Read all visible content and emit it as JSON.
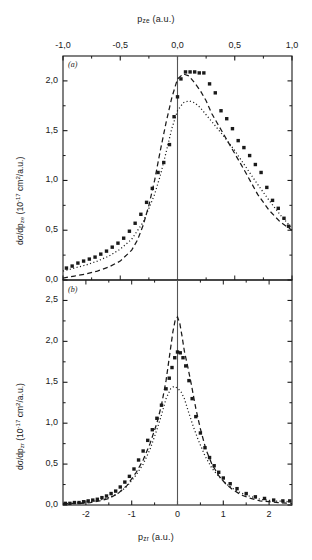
{
  "figure": {
    "background": "#ffffff",
    "foreground": "#1a1a1a",
    "width": 312,
    "height": 560
  },
  "panel_a": {
    "tag": "(a)",
    "top_axis_title_html": "p<sub>ze</sub> (a.u.)",
    "ylabel_html": "d&sigma;/dp<sub>ze</sub> (10<sup>-17</sup> cm<sup>2</sup>/a.u.)",
    "xticks": [
      "-1,0",
      "-0,5",
      "0,0",
      "0,5",
      "1,0"
    ],
    "xtick_values": [
      -1.0,
      -0.5,
      0.0,
      0.5,
      1.0
    ],
    "yticks": [
      "0,0",
      "0,5",
      "1,0",
      "1,5",
      "2,0"
    ],
    "ytick_values": [
      0.0,
      0.5,
      1.0,
      1.5,
      2.0
    ]
  },
  "panel_b": {
    "tag": "(b)",
    "bottom_axis_title_html": "p<sub>zr</sub> (a.u.)",
    "ylabel_html": "d&sigma;/dp<sub>zr</sub> (10<sup>-17</sup> cm<sup>2</sup>/a.u.)",
    "xticks": [
      "-2",
      "-1",
      "0",
      "1",
      "2"
    ],
    "xtick_values": [
      -2,
      -1,
      0,
      1,
      2
    ],
    "yticks": [
      "0,0",
      "0,5",
      "1,0",
      "1,5",
      "2,0",
      "2,5"
    ],
    "ytick_values": [
      0.0,
      0.5,
      1.0,
      1.5,
      2.0,
      2.5
    ]
  },
  "chart_data": [
    {
      "type": "scatter",
      "panel": "(a)",
      "title": "",
      "xlabel": "p_ze (a.u.)",
      "ylabel": "dsigma/dp_ze (10^-17 cm^2/a.u.)",
      "xlim": [
        -1.0,
        1.0
      ],
      "ylim": [
        0.0,
        2.25
      ],
      "xtick_labels": [
        "-1,0",
        "-0,5",
        "0,0",
        "0,5",
        "1,0"
      ],
      "ytick_labels": [
        "0,0",
        "0,5",
        "1,0",
        "1,5",
        "2,0"
      ],
      "grid": false,
      "legend": "none",
      "axis_position": "x-axis on top",
      "vertical_reference_line_x": 0.0,
      "series": [
        {
          "name": "experiment",
          "style": "filled-square-markers",
          "marker": "square",
          "x": [
            -0.97,
            -0.92,
            -0.87,
            -0.82,
            -0.77,
            -0.72,
            -0.67,
            -0.62,
            -0.57,
            -0.52,
            -0.47,
            -0.42,
            -0.37,
            -0.32,
            -0.27,
            -0.22,
            -0.17,
            -0.12,
            -0.07,
            -0.03,
            0.0,
            0.03,
            0.07,
            0.11,
            0.15,
            0.19,
            0.23,
            0.28,
            0.33,
            0.38,
            0.43,
            0.48,
            0.53,
            0.58,
            0.63,
            0.68,
            0.73,
            0.78,
            0.83,
            0.88,
            0.93,
            0.97
          ],
          "y": [
            0.12,
            0.14,
            0.17,
            0.19,
            0.21,
            0.23,
            0.26,
            0.29,
            0.33,
            0.37,
            0.42,
            0.49,
            0.57,
            0.66,
            0.78,
            0.92,
            1.08,
            1.18,
            1.36,
            1.64,
            1.84,
            2.02,
            2.09,
            2.09,
            2.09,
            2.08,
            2.08,
            1.97,
            1.88,
            1.7,
            1.62,
            1.52,
            1.4,
            1.33,
            1.25,
            1.16,
            1.08,
            0.93,
            0.8,
            0.72,
            0.62,
            0.54,
            0.45
          ]
        },
        {
          "name": "theory-dashed",
          "style": "dashed-line",
          "x": [
            -1.0,
            -0.9,
            -0.8,
            -0.7,
            -0.6,
            -0.5,
            -0.4,
            -0.35,
            -0.3,
            -0.25,
            -0.2,
            -0.15,
            -0.1,
            -0.05,
            0.0,
            0.05,
            0.1,
            0.15,
            0.2,
            0.25,
            0.3,
            0.35,
            0.4,
            0.5,
            0.6,
            0.7,
            0.8,
            0.9,
            1.0
          ],
          "y": [
            0.02,
            0.04,
            0.06,
            0.09,
            0.13,
            0.19,
            0.3,
            0.4,
            0.55,
            0.75,
            1.0,
            1.3,
            1.58,
            1.83,
            2.02,
            2.07,
            2.05,
            1.98,
            1.9,
            1.8,
            1.67,
            1.57,
            1.47,
            1.27,
            1.07,
            0.86,
            0.7,
            0.58,
            0.5
          ]
        },
        {
          "name": "theory-dotted",
          "style": "dotted-line",
          "x": [
            -1.0,
            -0.9,
            -0.8,
            -0.7,
            -0.6,
            -0.5,
            -0.4,
            -0.3,
            -0.2,
            -0.15,
            -0.1,
            -0.05,
            0.0,
            0.05,
            0.1,
            0.15,
            0.2,
            0.3,
            0.4,
            0.5,
            0.6,
            0.7,
            0.8,
            0.9,
            1.0
          ],
          "y": [
            0.09,
            0.12,
            0.15,
            0.19,
            0.24,
            0.31,
            0.41,
            0.58,
            0.86,
            1.05,
            1.28,
            1.52,
            1.7,
            1.78,
            1.8,
            1.78,
            1.73,
            1.59,
            1.45,
            1.3,
            1.13,
            0.96,
            0.8,
            0.65,
            0.52
          ]
        }
      ]
    },
    {
      "type": "scatter",
      "panel": "(b)",
      "title": "",
      "xlabel": "p_zr (a.u.)",
      "ylabel": "dsigma/dp_zr (10^-17 cm^2/a.u.)",
      "xlim": [
        -2.5,
        2.5
      ],
      "ylim": [
        0.0,
        2.75
      ],
      "xtick_labels": [
        "-2",
        "-1",
        "0",
        "1",
        "2"
      ],
      "ytick_labels": [
        "0,0",
        "0,5",
        "1,0",
        "1,5",
        "2,0",
        "2,5"
      ],
      "grid": false,
      "legend": "none",
      "axis_position": "x-axis on bottom",
      "vertical_reference_line_x": 0.0,
      "series": [
        {
          "name": "experiment",
          "style": "filled-square-markers",
          "marker": "square",
          "x": [
            -2.45,
            -2.35,
            -2.25,
            -2.15,
            -2.05,
            -1.95,
            -1.85,
            -1.75,
            -1.65,
            -1.55,
            -1.45,
            -1.35,
            -1.25,
            -1.15,
            -1.05,
            -0.95,
            -0.85,
            -0.75,
            -0.65,
            -0.55,
            -0.45,
            -0.35,
            -0.25,
            -0.18,
            -0.12,
            -0.06,
            0.0,
            0.06,
            0.12,
            0.18,
            0.25,
            0.32,
            0.4,
            0.5,
            0.6,
            0.7,
            0.8,
            0.9,
            1.0,
            1.15,
            1.3,
            1.5,
            1.7,
            1.9,
            2.1,
            2.3,
            2.45
          ],
          "y": [
            0.02,
            0.02,
            0.03,
            0.03,
            0.04,
            0.05,
            0.06,
            0.07,
            0.09,
            0.11,
            0.14,
            0.17,
            0.22,
            0.28,
            0.35,
            0.44,
            0.55,
            0.66,
            0.79,
            0.92,
            1.06,
            1.22,
            1.42,
            1.55,
            1.68,
            1.8,
            1.87,
            1.86,
            1.8,
            1.7,
            1.52,
            1.3,
            1.08,
            0.88,
            0.7,
            0.58,
            0.48,
            0.4,
            0.33,
            0.26,
            0.2,
            0.14,
            0.1,
            0.08,
            0.06,
            0.05,
            0.05
          ]
        },
        {
          "name": "theory-dashed",
          "style": "dashed-line",
          "x": [
            -2.5,
            -2.3,
            -2.1,
            -1.9,
            -1.7,
            -1.5,
            -1.3,
            -1.1,
            -0.9,
            -0.75,
            -0.6,
            -0.45,
            -0.35,
            -0.25,
            -0.18,
            -0.1,
            -0.05,
            0.0,
            0.05,
            0.1,
            0.15,
            0.22,
            0.3,
            0.4,
            0.5,
            0.62,
            0.75,
            0.9,
            1.05,
            1.2,
            1.4,
            1.6,
            1.8,
            2.0,
            2.2,
            2.5
          ],
          "y": [
            0.01,
            0.02,
            0.02,
            0.03,
            0.05,
            0.08,
            0.14,
            0.24,
            0.4,
            0.55,
            0.75,
            1.0,
            1.22,
            1.52,
            1.8,
            2.12,
            2.26,
            2.3,
            2.22,
            2.06,
            1.88,
            1.7,
            1.48,
            1.18,
            0.93,
            0.68,
            0.5,
            0.36,
            0.26,
            0.19,
            0.12,
            0.08,
            0.05,
            0.04,
            0.03,
            0.02
          ]
        },
        {
          "name": "theory-dotted",
          "style": "dotted-line",
          "x": [
            -2.5,
            -2.3,
            -2.1,
            -1.9,
            -1.7,
            -1.5,
            -1.3,
            -1.1,
            -0.9,
            -0.75,
            -0.6,
            -0.45,
            -0.35,
            -0.25,
            -0.15,
            -0.08,
            0.0,
            0.08,
            0.15,
            0.25,
            0.35,
            0.45,
            0.6,
            0.75,
            0.9,
            1.1,
            1.3,
            1.5,
            1.8,
            2.1,
            2.5
          ],
          "y": [
            0.02,
            0.02,
            0.03,
            0.04,
            0.06,
            0.09,
            0.14,
            0.23,
            0.37,
            0.5,
            0.68,
            0.92,
            1.1,
            1.3,
            1.42,
            1.45,
            1.43,
            1.38,
            1.3,
            1.12,
            0.95,
            0.8,
            0.6,
            0.45,
            0.35,
            0.24,
            0.17,
            0.12,
            0.07,
            0.05,
            0.04
          ]
        }
      ]
    }
  ]
}
